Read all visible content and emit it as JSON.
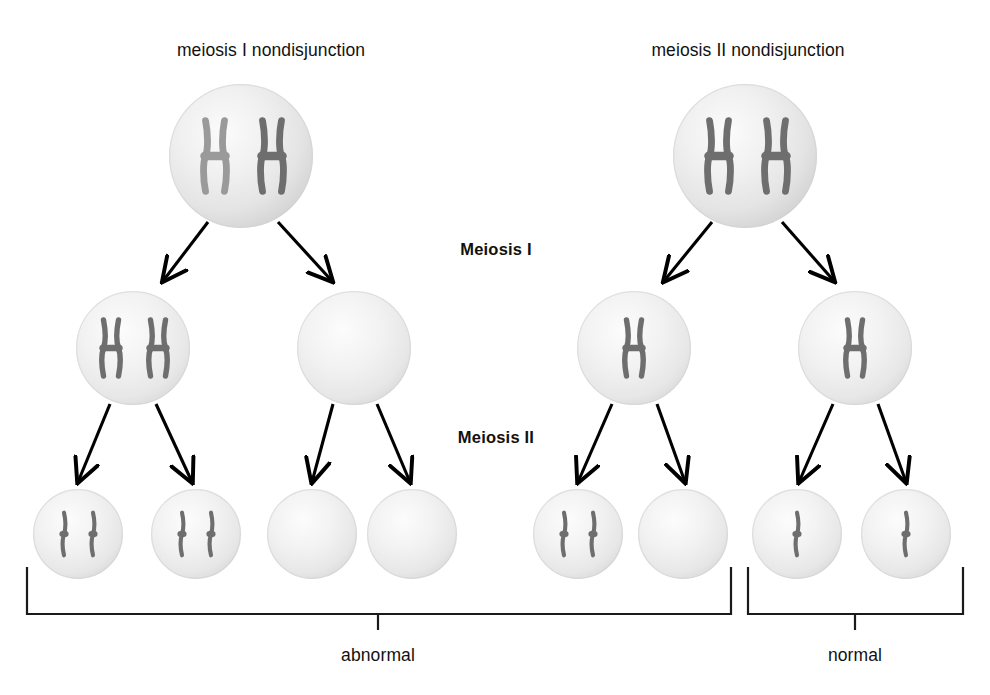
{
  "figure": {
    "title_left": "meiosis I nondisjunction",
    "title_right": "meiosis II nondisjunction",
    "stage_one_label": "Meiosis I",
    "stage_two_label": "Meiosis II",
    "outcome_abnormal": "abnormal",
    "outcome_normal": "normal"
  },
  "colors": {
    "background": "#ffffff",
    "cell_fill_light": "#f2f2f2",
    "cell_fill_mid": "#e2e2e2",
    "cell_fill_edge": "#cfcfcf",
    "chromosome_dark": "#6e6e6e",
    "chromosome_light": "#9a9a9a",
    "arrow": "#000000",
    "bracket": "#1a1a1a",
    "text": "#111111"
  },
  "labels": [
    {
      "id": "title-left",
      "text": "meiosis I nondisjunction",
      "x": 271,
      "y": 40,
      "kind": "top-label"
    },
    {
      "id": "title-right",
      "text": "meiosis II nondisjunction",
      "x": 748,
      "y": 40,
      "kind": "top-label"
    },
    {
      "id": "stage-one",
      "text": "Meiosis I",
      "x": 496,
      "y": 240,
      "kind": "stage-label"
    },
    {
      "id": "stage-two",
      "text": "Meiosis II",
      "x": 496,
      "y": 428,
      "kind": "stage-label"
    },
    {
      "id": "outcome-left",
      "text": "abnormal",
      "x": 378,
      "y": 645,
      "kind": "outcome-label"
    },
    {
      "id": "outcome-right",
      "text": "normal",
      "x": 855,
      "y": 645,
      "kind": "outcome-label"
    }
  ],
  "cells": [
    {
      "id": "parent-left",
      "row": "parent",
      "cx": 241,
      "cy": 156,
      "r": 72,
      "chromosomes": [
        {
          "shape": "duplicated",
          "x": 215,
          "tone": "light"
        },
        {
          "shape": "duplicated",
          "x": 272,
          "tone": "dark"
        }
      ]
    },
    {
      "id": "parent-right",
      "row": "parent",
      "cx": 745,
      "cy": 156,
      "r": 72,
      "chromosomes": [
        {
          "shape": "duplicated",
          "x": 719,
          "tone": "dark"
        },
        {
          "shape": "duplicated",
          "x": 776,
          "tone": "dark"
        }
      ]
    },
    {
      "id": "m1-left-a",
      "row": "meiosis1",
      "cx": 133,
      "cy": 348,
      "r": 57,
      "chromosomes": [
        {
          "shape": "duplicated",
          "x": 111,
          "tone": "dark"
        },
        {
          "shape": "duplicated",
          "x": 158,
          "tone": "dark"
        }
      ]
    },
    {
      "id": "m1-left-b",
      "row": "meiosis1",
      "cx": 354,
      "cy": 348,
      "r": 57,
      "chromosomes": []
    },
    {
      "id": "m1-right-a",
      "row": "meiosis1",
      "cx": 634,
      "cy": 348,
      "r": 57,
      "chromosomes": [
        {
          "shape": "duplicated",
          "x": 634,
          "tone": "dark"
        }
      ]
    },
    {
      "id": "m1-right-b",
      "row": "meiosis1",
      "cx": 855,
      "cy": 348,
      "r": 57,
      "chromosomes": [
        {
          "shape": "duplicated",
          "x": 855,
          "tone": "dark"
        }
      ]
    },
    {
      "id": "gamete-1",
      "row": "meiosis2",
      "cx": 78,
      "cy": 534,
      "r": 45,
      "chromosomes": [
        {
          "shape": "single",
          "x": 64,
          "tone": "dark"
        },
        {
          "shape": "single",
          "x": 93,
          "tone": "dark"
        }
      ]
    },
    {
      "id": "gamete-2",
      "row": "meiosis2",
      "cx": 196,
      "cy": 534,
      "r": 45,
      "chromosomes": [
        {
          "shape": "single",
          "x": 182,
          "tone": "dark"
        },
        {
          "shape": "single",
          "x": 211,
          "tone": "dark"
        }
      ]
    },
    {
      "id": "gamete-3",
      "row": "meiosis2",
      "cx": 312,
      "cy": 534,
      "r": 45,
      "chromosomes": []
    },
    {
      "id": "gamete-4",
      "row": "meiosis2",
      "cx": 412,
      "cy": 534,
      "r": 45,
      "chromosomes": []
    },
    {
      "id": "gamete-5",
      "row": "meiosis2",
      "cx": 578,
      "cy": 534,
      "r": 45,
      "chromosomes": [
        {
          "shape": "single",
          "x": 564,
          "tone": "dark"
        },
        {
          "shape": "single",
          "x": 593,
          "tone": "dark"
        }
      ]
    },
    {
      "id": "gamete-6",
      "row": "meiosis2",
      "cx": 683,
      "cy": 534,
      "r": 45,
      "chromosomes": []
    },
    {
      "id": "gamete-7",
      "row": "meiosis2",
      "cx": 797,
      "cy": 534,
      "r": 45,
      "chromosomes": [
        {
          "shape": "single",
          "x": 797,
          "tone": "dark"
        }
      ]
    },
    {
      "id": "gamete-8",
      "row": "meiosis2",
      "cx": 906,
      "cy": 534,
      "r": 45,
      "chromosomes": [
        {
          "shape": "single",
          "x": 906,
          "tone": "dark"
        }
      ]
    }
  ],
  "arrows": [
    {
      "id": "arrow-p-left-1",
      "x1": 208,
      "y1": 222,
      "x2": 163,
      "y2": 281
    },
    {
      "id": "arrow-p-left-2",
      "x1": 278,
      "y1": 222,
      "x2": 332,
      "y2": 281
    },
    {
      "id": "arrow-p-right-1",
      "x1": 712,
      "y1": 222,
      "x2": 664,
      "y2": 281
    },
    {
      "id": "arrow-p-right-2",
      "x1": 782,
      "y1": 222,
      "x2": 834,
      "y2": 281
    },
    {
      "id": "arrow-m1-la-1",
      "x1": 110,
      "y1": 404,
      "x2": 78,
      "y2": 482
    },
    {
      "id": "arrow-m1-la-2",
      "x1": 156,
      "y1": 404,
      "x2": 192,
      "y2": 482
    },
    {
      "id": "arrow-m1-lb-1",
      "x1": 333,
      "y1": 404,
      "x2": 312,
      "y2": 482
    },
    {
      "id": "arrow-m1-lb-2",
      "x1": 377,
      "y1": 404,
      "x2": 410,
      "y2": 482
    },
    {
      "id": "arrow-m1-ra-1",
      "x1": 612,
      "y1": 404,
      "x2": 578,
      "y2": 482
    },
    {
      "id": "arrow-m1-ra-2",
      "x1": 657,
      "y1": 404,
      "x2": 685,
      "y2": 482
    },
    {
      "id": "arrow-m1-rb-1",
      "x1": 833,
      "y1": 404,
      "x2": 799,
      "y2": 482
    },
    {
      "id": "arrow-m1-rb-2",
      "x1": 878,
      "y1": 404,
      "x2": 906,
      "y2": 482
    }
  ],
  "brackets": [
    {
      "id": "bracket-abnormal",
      "x_left": 27,
      "x_right": 731,
      "y_top": 567,
      "y_bottom": 614,
      "tick_x": 378,
      "tick_bottom": 630
    },
    {
      "id": "bracket-normal",
      "x_left": 748,
      "x_right": 963,
      "y_top": 567,
      "y_bottom": 614,
      "tick_x": 855,
      "tick_bottom": 630
    }
  ]
}
